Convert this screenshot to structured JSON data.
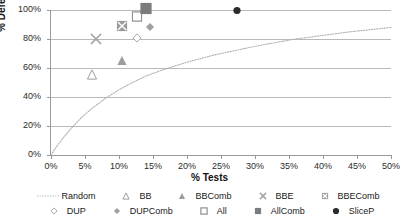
{
  "chart_data": {
    "type": "scatter",
    "title": "",
    "xlabel": "% Tests",
    "ylabel": "% Defects",
    "xlim": [
      0,
      50
    ],
    "ylim": [
      0,
      100
    ],
    "xticks": [
      "0%",
      "5%",
      "10%",
      "15%",
      "20%",
      "25%",
      "30%",
      "35%",
      "40%",
      "45%",
      "50%"
    ],
    "yticks": [
      "0%",
      "20%",
      "40%",
      "60%",
      "80%",
      "100%"
    ],
    "grid": "horizontal",
    "legend_position": "bottom",
    "series": [
      {
        "name": "Random",
        "marker": "dotted-line",
        "color": "#b0b0b0",
        "points": [
          [
            0,
            0
          ],
          [
            1,
            7
          ],
          [
            2,
            13
          ],
          [
            3,
            18.5
          ],
          [
            4,
            23.5
          ],
          [
            5,
            28
          ],
          [
            6,
            32
          ],
          [
            7,
            35.5
          ],
          [
            8,
            39
          ],
          [
            9,
            42
          ],
          [
            10,
            45
          ],
          [
            12,
            50
          ],
          [
            14,
            54.5
          ],
          [
            16,
            58
          ],
          [
            18,
            61
          ],
          [
            20,
            64
          ],
          [
            22,
            66.5
          ],
          [
            24,
            69
          ],
          [
            26,
            71
          ],
          [
            28,
            73
          ],
          [
            30,
            75
          ],
          [
            33,
            77.5
          ],
          [
            36,
            80
          ],
          [
            40,
            82.5
          ],
          [
            44,
            85
          ],
          [
            47,
            86.5
          ],
          [
            50,
            88
          ]
        ]
      },
      {
        "name": "BB",
        "marker": "triangle-open",
        "color": "#9d9d9d",
        "points": [
          [
            6.0,
            55
          ]
        ]
      },
      {
        "name": "BBComb",
        "marker": "triangle-filled",
        "color": "#9d9d9d",
        "points": [
          [
            10.4,
            65
          ]
        ]
      },
      {
        "name": "BBE",
        "marker": "cross-x",
        "color": "#a5a5a5",
        "points": [
          [
            6.6,
            79
          ]
        ]
      },
      {
        "name": "BBEComb",
        "marker": "square-x",
        "color": "#9a9a9a",
        "points": [
          [
            10.4,
            88
          ]
        ]
      },
      {
        "name": "DUP",
        "marker": "diamond-open",
        "color": "#a8a8a8",
        "points": [
          [
            12.6,
            81
          ]
        ]
      },
      {
        "name": "DUPComb",
        "marker": "diamond-filled",
        "color": "#a0a0a0",
        "points": [
          [
            14.5,
            88
          ]
        ]
      },
      {
        "name": "All",
        "marker": "square-open",
        "color": "#8f8f8f",
        "points": [
          [
            12.6,
            95
          ]
        ]
      },
      {
        "name": "AllComb",
        "marker": "square-filled",
        "color": "#7c7c7c",
        "points": [
          [
            14.0,
            100
          ]
        ]
      },
      {
        "name": "SliceP",
        "marker": "circle-filled",
        "color": "#2b2b2b",
        "points": [
          [
            27.3,
            100
          ]
        ]
      }
    ]
  },
  "axes": {
    "y_title": "% Defects",
    "x_title": "% Tests",
    "y_tick_labels": [
      "100%",
      "80%",
      "60%",
      "40%",
      "20%",
      "0%"
    ],
    "x_tick_labels": [
      "0%",
      "5%",
      "10%",
      "15%",
      "20%",
      "25%",
      "30%",
      "35%",
      "40%",
      "45%",
      "50%"
    ]
  },
  "legend": {
    "row1": [
      {
        "label": "Random",
        "key": "dotted-line-key"
      },
      {
        "label": "BB",
        "key": "triangle-open-key"
      },
      {
        "label": "BBComb",
        "key": "triangle-filled-key"
      },
      {
        "label": "BBE",
        "key": "cross-x-key"
      },
      {
        "label": "BBEComb",
        "key": "square-x-key"
      }
    ],
    "row2": [
      {
        "label": "DUP",
        "key": "diamond-open-key"
      },
      {
        "label": "DUPComb",
        "key": "diamond-filled-key"
      },
      {
        "label": "All",
        "key": "square-open-key"
      },
      {
        "label": "AllComb",
        "key": "square-filled-key"
      },
      {
        "label": "SliceP",
        "key": "circle-filled-key"
      }
    ]
  },
  "colors": {
    "grid": "#b9b9b9",
    "axis": "#9a9a9a",
    "text": "#1a1a1a",
    "random_curve": "#b0b0b0",
    "marker_gray": "#9d9d9d",
    "marker_dark": "#7c7c7c",
    "marker_black": "#2b2b2b"
  }
}
